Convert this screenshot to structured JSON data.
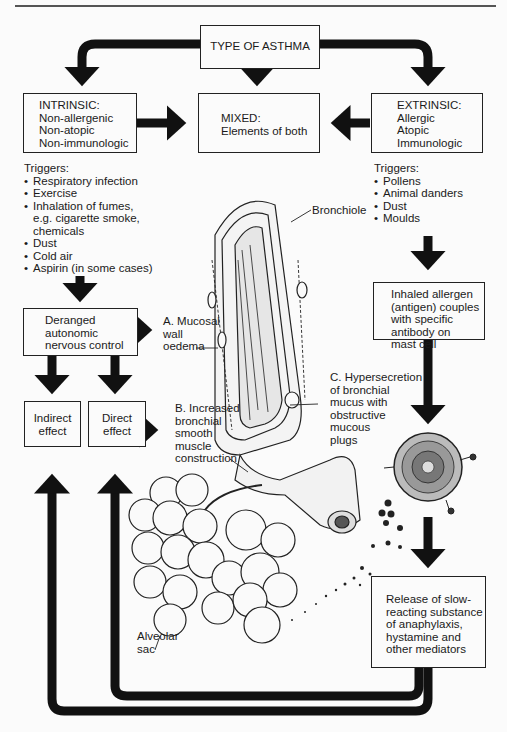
{
  "title_box": "TYPE OF ASTHMA",
  "intrinsic": {
    "heading": "INTRINSIC:",
    "lines": [
      "Non-allergenic",
      "Non-atopic",
      "Non-immunologic"
    ],
    "triggers_label": "Triggers:",
    "triggers": [
      {
        "text": "Respiratory infection"
      },
      {
        "text": "Exercise"
      },
      {
        "text": "Inhalation of fumes,",
        "cont": [
          "e.g. cigarette smoke,",
          "chemicals"
        ]
      },
      {
        "text": "Dust"
      },
      {
        "text": "Cold air"
      },
      {
        "text": "Aspirin (in some cases)"
      }
    ]
  },
  "mixed": {
    "heading": "MIXED:",
    "line": "Elements of both"
  },
  "extrinsic": {
    "heading": "EXTRINSIC:",
    "lines": [
      "Allergic",
      "Atopic",
      "Immunologic"
    ],
    "triggers_label": "Triggers:",
    "triggers": [
      "Pollens",
      "Animal danders",
      "Dust",
      "Moulds"
    ]
  },
  "deranged_box": [
    "Deranged",
    "autonomic",
    "nervous control"
  ],
  "indirect_box": [
    "Indirect",
    "effect"
  ],
  "direct_box": [
    "Direct",
    "effect"
  ],
  "inhaled_box": [
    "Inhaled allergen",
    "(antigen) couples",
    "with specific",
    "antibody on",
    "mast cell"
  ],
  "release_box": [
    "Release of slow-",
    "reacting substance",
    "of anaphylaxis,",
    "hystamine and",
    "other mediators"
  ],
  "labels": {
    "bronchiole": "Bronchiole",
    "mucosal": [
      "A. Mucosal",
      "wall",
      "oedema"
    ],
    "smooth_muscle": [
      "B. Increased",
      "bronchial",
      "smooth",
      "muscle",
      "construction"
    ],
    "hypersecretion": [
      "C. Hypersecretion",
      "of bronchial",
      "mucus with",
      "obstructive",
      "mucous",
      "plugs"
    ],
    "alveolar": [
      "Alveolar",
      "sac"
    ]
  },
  "illustrations": [
    "bronchiole-cross-section",
    "alveolar-sac-cluster",
    "mast-cell-with-antibodies",
    "mediator-granules"
  ]
}
